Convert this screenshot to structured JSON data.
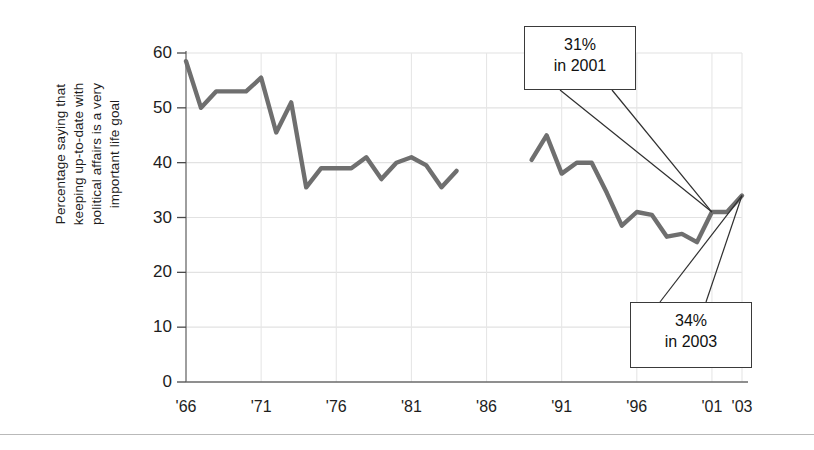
{
  "chart_data": {
    "type": "line",
    "title": "",
    "xlabel": "",
    "ylabel": "Percentage saying that\nkeeping up-to-date with\npolitical affairs is a very\nimportant life goal",
    "ylim": [
      0,
      60
    ],
    "xlim": [
      1966,
      2003
    ],
    "grid": true,
    "legend": "none",
    "y_ticks": [
      "0",
      "10",
      "20",
      "30",
      "40",
      "50",
      "60"
    ],
    "y_tick_values": [
      0,
      10,
      20,
      30,
      40,
      50,
      60
    ],
    "x_ticks": [
      "'66",
      "'71",
      "'76",
      "'81",
      "'86",
      "'91",
      "'96",
      "'01",
      "'03"
    ],
    "x_tick_values": [
      1966,
      1971,
      1976,
      1981,
      1986,
      1991,
      1996,
      2001,
      2003
    ],
    "line_color": "#6f6f6f",
    "series": [
      {
        "name": "Percentage rating political affairs a very important life goal",
        "x": [
          1966,
          1967,
          1968,
          1969,
          1970,
          1971,
          1972,
          1973,
          1974,
          1975,
          1976,
          1977,
          1978,
          1979,
          1980,
          1981,
          1982,
          1983,
          1984
        ],
        "values": [
          58.5,
          50.0,
          53.0,
          53.0,
          53.0,
          55.5,
          45.5,
          51.0,
          35.5,
          39.0,
          39.0,
          39.0,
          41.0,
          37.0,
          40.0,
          41.0,
          39.5,
          35.5,
          38.5
        ]
      },
      {
        "name": "Percentage rating political affairs a very important life goal (continued)",
        "x": [
          1989,
          1990,
          1991,
          1992,
          1993,
          1994,
          1995,
          1996,
          1997,
          1998,
          1999,
          2000,
          2001,
          2002,
          2003
        ],
        "values": [
          40.5,
          45.0,
          38.0,
          40.0,
          40.0,
          34.5,
          28.5,
          31.0,
          30.5,
          26.5,
          27.0,
          25.5,
          31.0,
          31.0,
          34.0
        ]
      }
    ],
    "annotations": [
      {
        "id": "callout-2001",
        "value": 31,
        "year": 2001,
        "line1": "31%",
        "line2": "in 2001"
      },
      {
        "id": "callout-2003",
        "value": 34,
        "year": 2003,
        "line1": "34%",
        "line2": "in 2003"
      }
    ]
  },
  "axis": {
    "y_label_text": "Percentage saying that\nkeeping up-to-date with\npolitical affairs is a very\nimportant life goal"
  }
}
